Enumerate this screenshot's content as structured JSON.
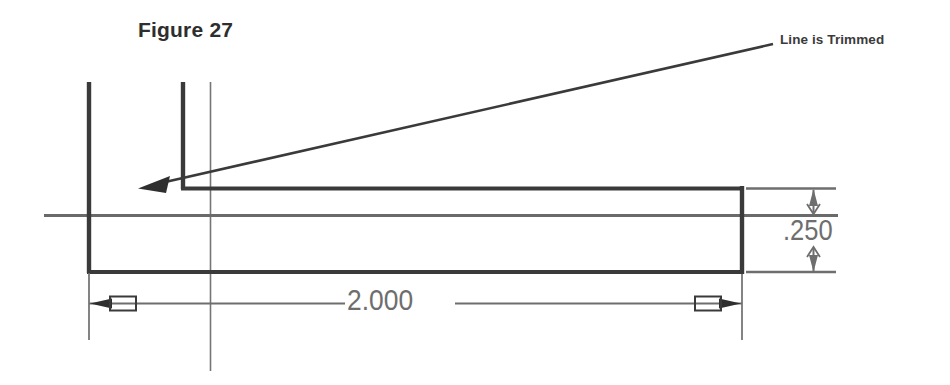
{
  "figure": {
    "title": "Figure 27"
  },
  "annotations": {
    "leader_label": "Line is Trimmed"
  },
  "dimensions": {
    "length": "2.000",
    "thickness": ".250"
  },
  "colors": {
    "background": "#ffffff",
    "object_line": "#3a3a3a",
    "center_line": "#6a6a6a",
    "thin_line": "#777777",
    "dimension_text": "#6e6e6e",
    "label_text": "#3b3b3b",
    "title_text": "#2e2e2e"
  },
  "icons": {
    "leader_arrow": "arrow-left-icon",
    "dim_arrow_left": "dimension-arrow-left-icon",
    "dim_arrow_right": "dimension-arrow-right-icon",
    "dim_arrow_up": "dimension-arrow-up-icon",
    "dim_arrow_down": "dimension-arrow-down-icon"
  }
}
